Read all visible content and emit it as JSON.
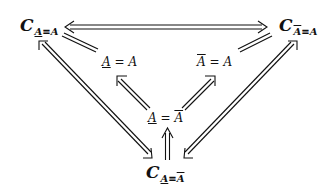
{
  "nodes": {
    "top_left": {
      "c": "C",
      "lhs": "A",
      "rel": "≡",
      "rhs": "A",
      "lhs_mark": "underline",
      "rhs_mark": "none"
    },
    "top_right": {
      "c": "C",
      "lhs": "A",
      "rel": "≡",
      "rhs": "A",
      "lhs_mark": "overline",
      "rhs_mark": "none"
    },
    "bottom": {
      "c": "C",
      "lhs": "A",
      "rel": "≡",
      "rhs": "A",
      "lhs_mark": "underline",
      "rhs_mark": "overline"
    },
    "mid_left": {
      "lhs": "A",
      "rel": "=",
      "rhs": "A",
      "lhs_mark": "underline",
      "rhs_mark": "none"
    },
    "mid_right": {
      "lhs": "A",
      "rel": "=",
      "rhs": "A",
      "lhs_mark": "overline",
      "rhs_mark": "none"
    },
    "mid_center": {
      "lhs": "A",
      "rel": "=",
      "rhs": "A",
      "lhs_mark": "underline",
      "rhs_mark": "overline"
    }
  },
  "edges": [
    {
      "from": "top_left",
      "to": "top_right",
      "type": "double-arrow-bidirectional"
    },
    {
      "from": "top_left",
      "to": "bottom",
      "type": "double-arrow-bidirectional"
    },
    {
      "from": "top_right",
      "to": "bottom",
      "type": "double-arrow-bidirectional"
    },
    {
      "from": "mid_left",
      "to": "top_left",
      "type": "equality-lines"
    },
    {
      "from": "mid_right",
      "to": "top_right",
      "type": "equality-lines"
    },
    {
      "from": "mid_center",
      "to": "mid_left",
      "type": "double-arrow"
    },
    {
      "from": "mid_center",
      "to": "mid_right",
      "type": "double-arrow"
    },
    {
      "from": "bottom",
      "to": "mid_center",
      "type": "double-arrow"
    }
  ],
  "colors": {
    "ink": "#111111",
    "background": "#ffffff"
  }
}
